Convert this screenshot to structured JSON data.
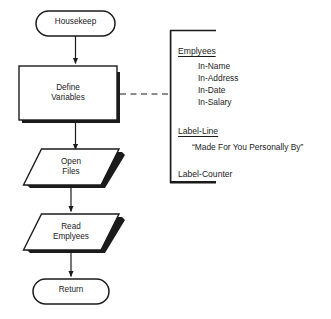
{
  "diagram": {
    "type": "flowchart",
    "colors": {
      "stroke": "#1b1b1b",
      "fill": "#ffffff",
      "shadow": "#1b1b1b",
      "text": "#1b1b1b",
      "dashed_connector": "#1b1b1b"
    },
    "nodes": [
      {
        "id": "start",
        "shape": "terminator",
        "label": "Housekeep"
      },
      {
        "id": "define",
        "shape": "process",
        "label": "Define\nVariables"
      },
      {
        "id": "open",
        "shape": "input-output",
        "label": "Open\nFiles"
      },
      {
        "id": "read",
        "shape": "input-output",
        "label": "Read\nEmplyees"
      },
      {
        "id": "return",
        "shape": "terminator",
        "label": "Return"
      }
    ],
    "edges": [
      {
        "from": "start",
        "to": "define",
        "style": "solid-arrow"
      },
      {
        "from": "define",
        "to": "open",
        "style": "solid-arrow"
      },
      {
        "from": "open",
        "to": "read",
        "style": "solid-arrow"
      },
      {
        "from": "read",
        "to": "return",
        "style": "solid-arrow"
      },
      {
        "from": "define",
        "to": "annotation",
        "style": "dashed"
      }
    ]
  },
  "annotation": {
    "bracket": "left-square-bracket",
    "groups": [
      {
        "heading": "Emplyees",
        "underlined": true,
        "items": [
          "In-Name",
          "In-Address",
          "In-Date",
          "In-Salary"
        ]
      },
      {
        "heading": "Label-Line",
        "underlined": true,
        "quote": "“Made For You Personally By”"
      },
      {
        "heading": "Label-Counter",
        "underlined": false
      }
    ]
  }
}
